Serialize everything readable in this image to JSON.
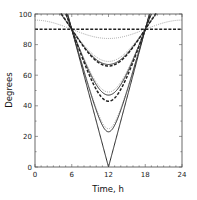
{
  "chart_data": {
    "type": "line",
    "title": "",
    "xlabel": "Time, h",
    "ylabel": "Degrees",
    "xlim": [
      0,
      24
    ],
    "ylim": [
      0,
      100
    ],
    "xticks": [
      0,
      6,
      12,
      18,
      24
    ],
    "yticks": [
      0,
      20,
      40,
      60,
      80,
      100
    ],
    "grid": false,
    "legend": null,
    "x_center": 12,
    "series": [
      {
        "name": "solid min 0",
        "style": "solid",
        "min_at_12": 0,
        "value_at_0": 180
      },
      {
        "name": "solid min 23",
        "style": "solid",
        "min_at_12": 23,
        "value_at_0": 157
      },
      {
        "name": "solid min 47",
        "style": "solid",
        "min_at_12": 47,
        "value_at_0": 133
      },
      {
        "name": "solid min 67",
        "style": "solid",
        "min_at_12": 67,
        "value_at_0": 113
      },
      {
        "name": "dotted min 25",
        "style": "dotted",
        "min_at_12": 25,
        "value_at_0": 155
      },
      {
        "name": "dotted min 49",
        "style": "dotted",
        "min_at_12": 49,
        "value_at_0": 131
      },
      {
        "name": "dotted min 69",
        "style": "dotted",
        "min_at_12": 69,
        "value_at_0": 111
      },
      {
        "name": "dotted min 84",
        "style": "dotted",
        "min_at_12": 84,
        "value_at_0": 96
      },
      {
        "name": "dashed min 43",
        "style": "dashed",
        "min_at_12": 43,
        "value_at_0": 137
      },
      {
        "name": "dashed min 66",
        "style": "dashed",
        "min_at_12": 66,
        "value_at_0": 114
      },
      {
        "name": "dashed min 90",
        "style": "dashed",
        "min_at_12": 90,
        "value_at_0": 90
      }
    ]
  },
  "axes": {
    "xlabel": "Time, h",
    "ylabel": "Degrees",
    "x_tick_labels": [
      "0",
      "6",
      "12",
      "18",
      "24"
    ],
    "y_tick_labels": [
      "0",
      "20",
      "40",
      "60",
      "80",
      "100"
    ]
  }
}
